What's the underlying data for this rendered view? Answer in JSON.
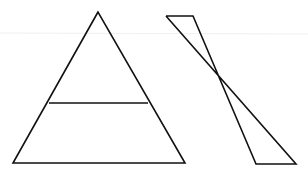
{
  "figure": {
    "background": "#ffffff",
    "stroke_color": "#111111",
    "faint_line_color": "#eeeeee",
    "shapes": [
      {
        "name": "triangle",
        "points": [
          [
            98,
            12
          ],
          [
            13,
            163
          ],
          [
            185,
            163
          ]
        ]
      },
      {
        "name": "triangle-midline",
        "from": [
          49,
          103
        ],
        "to": [
          148,
          103
        ]
      },
      {
        "name": "hourglass",
        "points": [
          [
            166,
            16
          ],
          [
            193,
            16
          ],
          [
            256,
            164
          ],
          [
            296,
            164
          ]
        ]
      }
    ]
  }
}
